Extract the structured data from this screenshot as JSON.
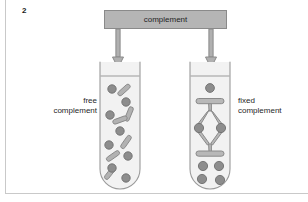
{
  "figure": {
    "number": "2",
    "source_box": {
      "label": "complement",
      "fill": "#b5b5b5",
      "stroke": "#8a8a8a"
    },
    "labels": {
      "left_line1": "free",
      "left_line2": "complement",
      "right_line1": "fixed",
      "right_line2": "complement"
    },
    "colors": {
      "background": "#ffffff",
      "rule": "#c9c9c9",
      "text": "#1f1f1f",
      "tube_stroke": "#9a9a9a",
      "tube_fill": "#f2f2f2",
      "particle_fill": "#8d8d8d",
      "particle_stroke": "#6f6f6f",
      "rod_fill": "#b2b2b2",
      "rod_stroke": "#8a8a8a",
      "antibody_fill": "#b8b8b8",
      "antibody_stroke": "#8a8a8a",
      "arrow_fill": "#b0b0b0",
      "arrow_stroke": "#8a8a8a"
    },
    "arrows": [
      {
        "name": "arrow-to-free-tube",
        "x": 118,
        "from_y": 29,
        "to_y": 68
      },
      {
        "name": "arrow-to-fixed-tube",
        "x": 211,
        "from_y": 29,
        "to_y": 68
      }
    ],
    "tubes": [
      {
        "name": "free-complement-tube",
        "x": 100,
        "y": 62,
        "width": 40,
        "height": 127,
        "liquid_level_y": 76,
        "contents_description": "scattered round particles and rod shaped complement"
      },
      {
        "name": "fixed-complement-tube",
        "x": 190,
        "y": 62,
        "width": 40,
        "height": 127,
        "liquid_level_y": 76,
        "contents_description": "antibody antigen lattice with sedimented particles"
      }
    ],
    "free_tube_particles": [
      {
        "cx": 112,
        "cy": 89,
        "r": 4.2
      },
      {
        "cx": 126,
        "cy": 102,
        "r": 4.2
      },
      {
        "cx": 110,
        "cy": 115,
        "r": 4.2
      },
      {
        "cx": 120,
        "cy": 131,
        "r": 4.2
      },
      {
        "cx": 109,
        "cy": 145,
        "r": 4.2
      },
      {
        "cx": 128,
        "cy": 156,
        "r": 4.2
      },
      {
        "cx": 112,
        "cy": 168,
        "r": 4.2
      },
      {
        "cx": 126,
        "cy": 178,
        "r": 4.2
      }
    ],
    "free_tube_rods": [
      {
        "cx": 124,
        "cy": 90,
        "angle": -42
      },
      {
        "cx": 129,
        "cy": 114,
        "angle": -68
      },
      {
        "cx": 120,
        "cy": 120,
        "angle": -20
      },
      {
        "cx": 126,
        "cy": 142,
        "angle": -55
      },
      {
        "cx": 113,
        "cy": 156,
        "angle": -35
      },
      {
        "cx": 110,
        "cy": 173,
        "angle": -52
      }
    ],
    "fixed_tube_particles": [
      {
        "cx": 210,
        "cy": 88,
        "r": 4.4
      },
      {
        "cx": 199,
        "cy": 128,
        "r": 4.6
      },
      {
        "cx": 221,
        "cy": 128,
        "r": 4.6
      },
      {
        "cx": 203,
        "cy": 166,
        "r": 4.6
      },
      {
        "cx": 219,
        "cy": 166,
        "r": 4.6
      },
      {
        "cx": 202,
        "cy": 179,
        "r": 4.6
      },
      {
        "cx": 220,
        "cy": 180,
        "r": 4.6
      }
    ]
  }
}
